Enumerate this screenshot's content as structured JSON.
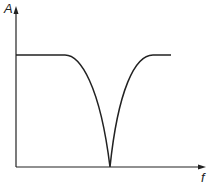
{
  "diagram": {
    "type": "notch-filter-response",
    "y_axis_label": "A",
    "x_axis_label": "f",
    "curve": {
      "passband_level": "high",
      "notch_depth": "zero",
      "shape": "flat - dip to zero at center frequency - flat"
    },
    "colors": {
      "line": "#222222",
      "background": "#ffffff"
    }
  }
}
